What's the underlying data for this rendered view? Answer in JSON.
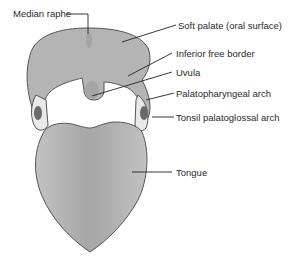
{
  "labels": {
    "median_raphe": "Median raphe",
    "soft_palate": "Soft palate (oral surface)",
    "inferior_free_border": "Inferior free border",
    "uvula": "Uvula",
    "palatopharyngeal_arch": "Palatopharyngeal arch",
    "tonsil_palatoglossal_arch": "Tonsil palatoglossal arch",
    "tongue": "Tongue"
  },
  "colors": {
    "tissue_fill": "#b4b4b4",
    "tissue_stroke": "#555555",
    "tonsil_fill": "#6a6a6a",
    "arch_fill": "#c8c8c8",
    "leader_line": "#222222",
    "text": "#2a2a2a"
  }
}
